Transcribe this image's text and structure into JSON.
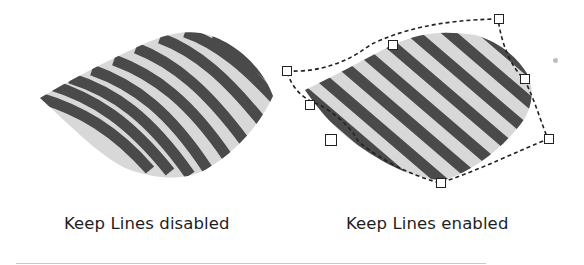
{
  "figure": {
    "left_panel": {
      "caption": "Keep Lines disabled",
      "description": "Distorted stripe fill where lines bend with envelope"
    },
    "right_panel": {
      "caption": "Keep Lines enabled",
      "description": "Envelope with dashed outline and square control nodes; stripes stay straight"
    }
  },
  "colors": {
    "background": "#ffffff",
    "stripe_dark": "#4a4a4a",
    "stripe_light": "#d8d8d8",
    "caption_text": "#1e1e1e",
    "envelope_outline": "#222222"
  },
  "envelope_nodes_count": 8
}
